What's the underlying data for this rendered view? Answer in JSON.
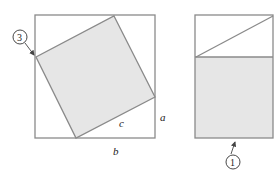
{
  "figure": {
    "left_panel": {
      "outer_square": {
        "x": 35,
        "y": 15,
        "w": 120,
        "h": 123
      },
      "inner_square_points": "114,16 155,97 76,138 36,57",
      "labels": {
        "c": "c",
        "a": "a",
        "b": "b"
      },
      "callout": {
        "number": "3"
      }
    },
    "right_panel": {
      "rect": {
        "x": 195,
        "y": 15,
        "w": 78,
        "h": 123
      },
      "divider_y": 57,
      "callout": {
        "number": "1"
      }
    },
    "colors": {
      "stroke": "#8a8a8a",
      "fill_shaded": "#e6e6e6",
      "text": "#222222"
    }
  }
}
